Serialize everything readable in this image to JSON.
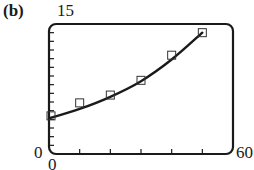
{
  "panel_label": "(b)",
  "axes": {
    "x_min_label": "0",
    "x_max_label": "60",
    "y_min_label": "0",
    "y_max_label": "15"
  },
  "chart_data": {
    "type": "scatter",
    "title": "",
    "panel": "(b)",
    "xlabel": "",
    "ylabel": "",
    "xlim": [
      0,
      60
    ],
    "ylim": [
      0,
      15
    ],
    "x_tick_step": 10,
    "y_tick_step": 1,
    "grid": false,
    "legend": null,
    "series": [
      {
        "name": "data points",
        "kind": "scatter",
        "marker": "open-square",
        "x": [
          0,
          10,
          20,
          30,
          40,
          50
        ],
        "y": [
          4.4,
          5.9,
          6.8,
          8.5,
          11.4,
          14.0
        ]
      },
      {
        "name": "fitted curve",
        "kind": "line",
        "shape": "increasing, concave up",
        "x": [
          0,
          10,
          20,
          30,
          40,
          50
        ],
        "y": [
          4.1,
          5.2,
          6.6,
          8.4,
          10.9,
          14.0
        ]
      }
    ]
  }
}
